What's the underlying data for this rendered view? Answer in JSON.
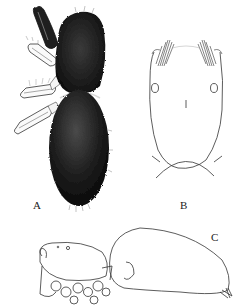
{
  "figure": {
    "panels": [
      {
        "label": "A",
        "view": "dorsal habitus, densely setose"
      },
      {
        "label": "B",
        "view": "carapace, dorsal outline"
      },
      {
        "label": "C",
        "view": "habitus, lateral outline"
      }
    ]
  },
  "colors": {
    "body_dark": "#1a1a1a",
    "line": "#333333",
    "background": "#ffffff"
  }
}
